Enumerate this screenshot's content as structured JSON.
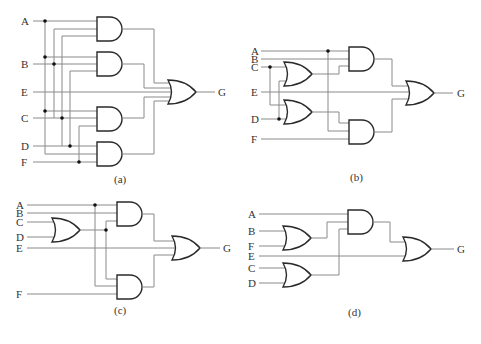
{
  "figure": {
    "panels": [
      {
        "id": "a",
        "caption": "(a)",
        "inputs": [
          "A",
          "B",
          "E",
          "C",
          "D",
          "F"
        ],
        "output": "G",
        "gates": [
          "AND",
          "AND",
          "AND",
          "AND",
          "OR"
        ]
      },
      {
        "id": "b",
        "caption": "(b)",
        "inputs": [
          "A",
          "B",
          "C",
          "E",
          "D",
          "F"
        ],
        "output": "G",
        "gates": [
          "OR",
          "OR",
          "AND",
          "AND",
          "OR"
        ]
      },
      {
        "id": "c",
        "caption": "(c)",
        "inputs": [
          "A",
          "B",
          "C",
          "D",
          "E",
          "F"
        ],
        "output": "G",
        "gates": [
          "OR",
          "AND",
          "AND",
          "OR"
        ]
      },
      {
        "id": "d",
        "caption": "(d)",
        "inputs": [
          "A",
          "B",
          "F",
          "E",
          "C",
          "D"
        ],
        "output": "G",
        "gates": [
          "OR",
          "OR",
          "AND",
          "OR"
        ]
      }
    ]
  }
}
